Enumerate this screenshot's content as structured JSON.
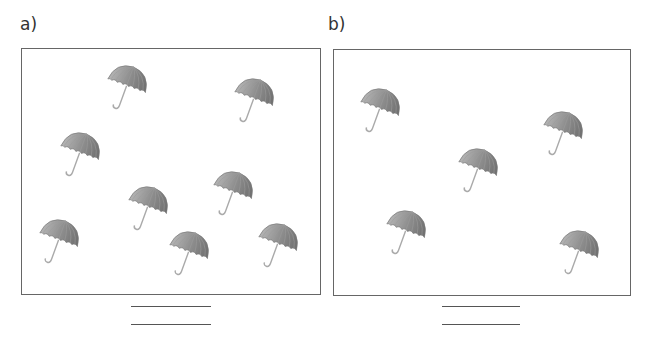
{
  "panels": [
    {
      "label": "a)",
      "umbrella_count": 8,
      "umbrellas": [
        {
          "x": 106,
          "y": 64
        },
        {
          "x": 233,
          "y": 77
        },
        {
          "x": 59,
          "y": 131
        },
        {
          "x": 127,
          "y": 185
        },
        {
          "x": 212,
          "y": 170
        },
        {
          "x": 38,
          "y": 218
        },
        {
          "x": 168,
          "y": 230
        },
        {
          "x": 257,
          "y": 222
        }
      ],
      "answer_lines": 2
    },
    {
      "label": "b)",
      "umbrella_count": 5,
      "umbrellas": [
        {
          "x": 359,
          "y": 87
        },
        {
          "x": 542,
          "y": 110
        },
        {
          "x": 457,
          "y": 147
        },
        {
          "x": 385,
          "y": 209
        },
        {
          "x": 558,
          "y": 229
        }
      ],
      "answer_lines": 2
    }
  ],
  "colors": {
    "umbrella": "#8a8a8a",
    "border": "#666666"
  }
}
